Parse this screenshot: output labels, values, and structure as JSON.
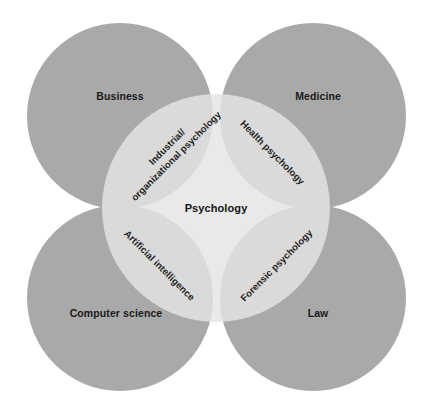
{
  "diagram": {
    "type": "venn",
    "background_color": "#ffffff",
    "colors": {
      "outer_circle": "#a9a9a9",
      "center_circle": "#d6d6d6",
      "overlap": "#bfbfbf",
      "label_text": "#1a1a1a"
    },
    "center": {
      "label": "Psychology",
      "cx": 216,
      "cy": 208,
      "r": 114
    },
    "outer_circles": [
      {
        "id": "business",
        "label": "Business",
        "cx": 120,
        "cy": 116,
        "r": 93,
        "label_x": 120,
        "label_y": 100
      },
      {
        "id": "medicine",
        "label": "Medicine",
        "cx": 313,
        "cy": 116,
        "r": 93,
        "label_x": 318,
        "label_y": 100
      },
      {
        "id": "computer-science",
        "label": "Computer science",
        "cx": 120,
        "cy": 298,
        "r": 93,
        "label_x": 116,
        "label_y": 316
      },
      {
        "id": "law",
        "label": "Law",
        "cx": 313,
        "cy": 298,
        "r": 93,
        "label_x": 318,
        "label_y": 316
      }
    ],
    "intersections": [
      {
        "id": "industrial-organizational-psychology",
        "lines": [
          "Industrial/",
          "organizational psychology"
        ],
        "between": [
          "Business",
          "Psychology"
        ],
        "x": 172,
        "y": 152,
        "rotation": -45
      },
      {
        "id": "health-psychology",
        "lines": [
          "Health psychology"
        ],
        "between": [
          "Medicine",
          "Psychology"
        ],
        "x": 273,
        "y": 152,
        "rotation": 45
      },
      {
        "id": "artificial-intelligence",
        "lines": [
          "Artificial intelligence"
        ],
        "between": [
          "Computer science",
          "Psychology"
        ],
        "x": 160,
        "y": 265,
        "rotation": 45
      },
      {
        "id": "forensic-psychology",
        "lines": [
          "Forensic psychology"
        ],
        "between": [
          "Law",
          "Psychology"
        ],
        "x": 276,
        "y": 265,
        "rotation": -45
      }
    ]
  }
}
